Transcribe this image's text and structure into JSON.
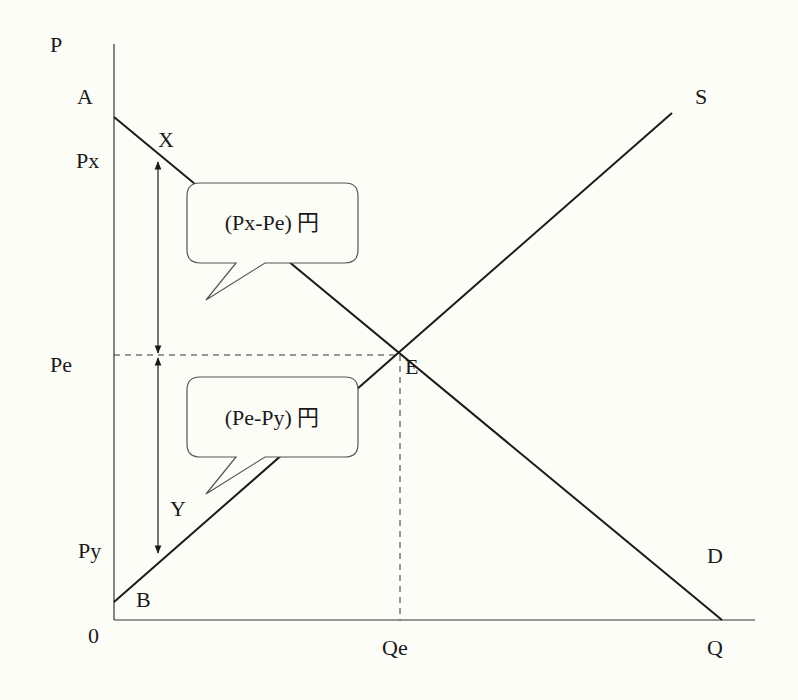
{
  "diagram": {
    "type": "supply-demand",
    "axes": {
      "y_label": "P",
      "x_label": "Q",
      "origin_label": "0"
    },
    "price_labels": {
      "a": "A",
      "px": "Px",
      "pe": "Pe",
      "py": "Py"
    },
    "quantity_labels": {
      "qe": "Qe"
    },
    "curve_labels": {
      "supply": "S",
      "demand": "D"
    },
    "point_labels": {
      "x": "X",
      "e": "E",
      "y": "Y",
      "b": "B"
    },
    "callouts": {
      "upper": "(Px-Pe) 円",
      "lower": "(Pe-Py) 円"
    },
    "colors": {
      "line": "#1a1a1a",
      "background": "#fdfdf8"
    }
  }
}
